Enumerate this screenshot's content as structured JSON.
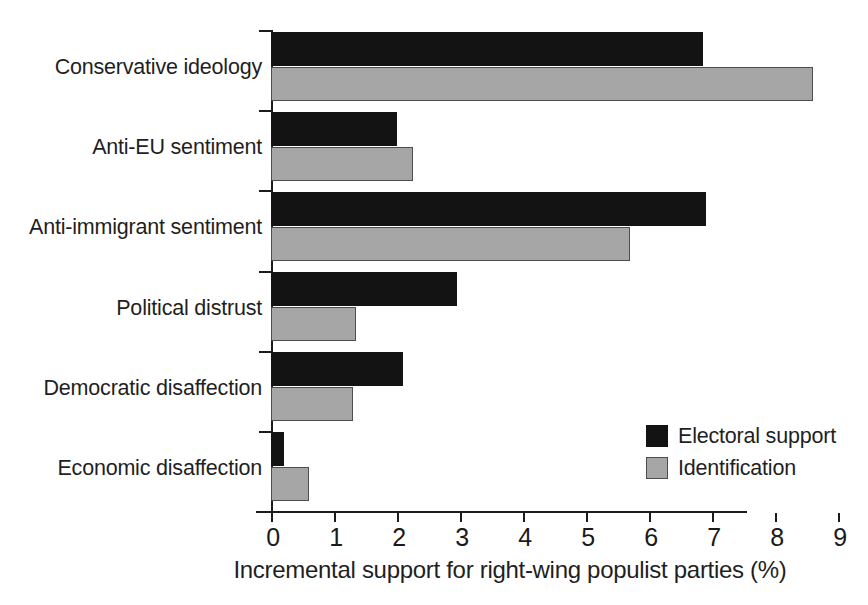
{
  "chart_data": {
    "type": "bar",
    "orientation": "horizontal",
    "title": "",
    "subtitle": "",
    "xlabel": "Incremental support for right-wing populist parties (%)",
    "ylabel": "",
    "xlim": [
      0,
      9
    ],
    "xticks": [
      "0",
      "1",
      "2",
      "3",
      "4",
      "5",
      "6",
      "7",
      "8",
      "9"
    ],
    "grid": false,
    "legend_position": "bottom-right",
    "categories": [
      "Conservative ideology",
      "Anti-EU sentiment",
      "Anti-immigrant sentiment",
      "Political distrust",
      "Democratic disaffection",
      "Economic disaffection"
    ],
    "series": [
      {
        "name": "Electoral support",
        "color": "#131313",
        "values": [
          6.85,
          2.0,
          6.9,
          2.95,
          2.1,
          0.2
        ]
      },
      {
        "name": "Identification",
        "color": "#a6a6a6",
        "values": [
          8.6,
          2.25,
          5.7,
          1.35,
          1.3,
          0.6
        ]
      }
    ]
  },
  "legend": {
    "items": [
      {
        "label": "Electoral support",
        "swatch": "electoral"
      },
      {
        "label": "Identification",
        "swatch": "identification"
      }
    ]
  },
  "axis": {
    "x_title": "Incremental support for right-wing populist parties (%)"
  }
}
